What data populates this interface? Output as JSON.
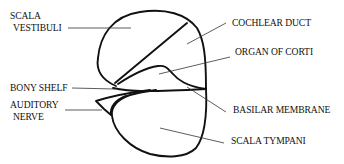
{
  "diagram": {
    "labels": {
      "scala_vestibuli_line1": "SCALA",
      "scala_vestibuli_line2": "VESTIBULI",
      "cochlear_duct": "COCHLEAR DUCT",
      "organ_of_corti": "ORGAN OF CORTI",
      "bony_shelf": "BONY SHELF",
      "auditory_nerve_line1": "AUDITORY",
      "auditory_nerve_line2": "NERVE",
      "basilar_membrane": "BASILAR MEMBRANE",
      "scala_tympani": "SCALA TYMPANI"
    },
    "colors": {
      "stroke": "#111111",
      "leader": "#333333",
      "background": "#ffffff"
    }
  }
}
